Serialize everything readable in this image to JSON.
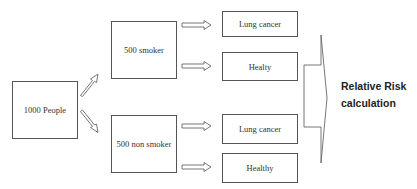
{
  "diagram": {
    "nodes": {
      "population": {
        "label": "1000 People"
      },
      "smoker": {
        "label": "500 smoker"
      },
      "non_smoker": {
        "label": "500 non smoker"
      },
      "smoker_cancer": {
        "label": "Lung cancer"
      },
      "smoker_healthy": {
        "label": "Healty"
      },
      "non_smoker_cancer": {
        "label": "Lung cancer"
      },
      "non_smoker_healthy": {
        "label": "Healthy"
      }
    },
    "outcome": {
      "line1": "Relative Risk",
      "line2": "calculation"
    },
    "edges": [
      {
        "from": "population",
        "to": "smoker"
      },
      {
        "from": "population",
        "to": "non_smoker"
      },
      {
        "from": "smoker",
        "to": "smoker_cancer"
      },
      {
        "from": "smoker",
        "to": "smoker_healthy"
      },
      {
        "from": "non_smoker",
        "to": "non_smoker_cancer"
      },
      {
        "from": "non_smoker",
        "to": "non_smoker_healthy"
      },
      {
        "from": "all_outcomes",
        "to": "outcome"
      }
    ],
    "colors": {
      "stroke": "#555555",
      "text": "#333333",
      "background": "#ffffff"
    }
  }
}
